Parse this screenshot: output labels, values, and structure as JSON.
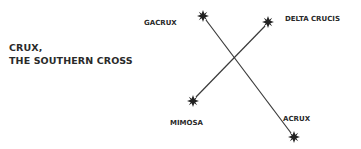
{
  "title": {
    "line1": "CRUX,",
    "line2": "THE SOUTHERN CROSS"
  },
  "stars": [
    {
      "name": "GACRUX",
      "x": 203,
      "y": 16
    },
    {
      "name": "DELTA CRUCIS",
      "x": 268,
      "y": 22
    },
    {
      "name": "MIMOSA",
      "x": 193,
      "y": 101
    },
    {
      "name": "ACRUX",
      "x": 294,
      "y": 137
    }
  ],
  "lines": [
    {
      "from": "GACRUX",
      "to": "ACRUX"
    },
    {
      "from": "DELTA CRUCIS",
      "to": "MIMOSA"
    }
  ],
  "colors": {
    "ink": "#2a2a2a",
    "background": "#ffffff"
  }
}
